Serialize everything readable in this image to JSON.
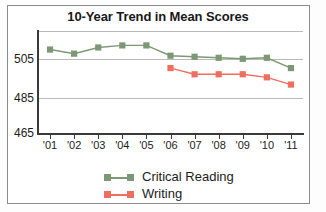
{
  "chart_data": {
    "type": "line",
    "title": "10-Year Trend in Mean Scores",
    "xlabel": "",
    "ylabel": "",
    "categories": [
      "'01",
      "'02",
      "'03",
      "'04",
      "'05",
      "'06",
      "'07",
      "'08",
      "'09",
      "'10",
      "'11"
    ],
    "ylim": [
      465,
      515
    ],
    "yticks": [
      465,
      485,
      505
    ],
    "grid": true,
    "legend_position": "bottom",
    "series": [
      {
        "name": "Critical Reading",
        "color": "#7d9874",
        "values": [
          506,
          504,
          507,
          508,
          508,
          503,
          502.5,
          502,
          501.5,
          502,
          497
        ]
      },
      {
        "name": "Writing",
        "color": "#ef6f5f",
        "values": [
          null,
          null,
          null,
          null,
          null,
          497,
          494,
          494,
          494,
          492.5,
          489
        ]
      }
    ]
  },
  "axis": {
    "ytick_labels": [
      "505",
      "485",
      "465"
    ],
    "xtick_labels": [
      "'01",
      "'02",
      "'03",
      "'04",
      "'05",
      "'06",
      "'07",
      "'08",
      "'09",
      "'10",
      "'11"
    ]
  },
  "legend": {
    "items": [
      {
        "label": "Critical Reading",
        "color": "#7d9874"
      },
      {
        "label": "Writing",
        "color": "#ef6f5f"
      }
    ]
  },
  "colors": {
    "critical_reading": "#7d9874",
    "writing": "#ef6f5f",
    "axis": "#3a3a3a",
    "grid": "#b9b9b9",
    "frame": "#8c8c8c",
    "text": "#1c1c1c"
  }
}
